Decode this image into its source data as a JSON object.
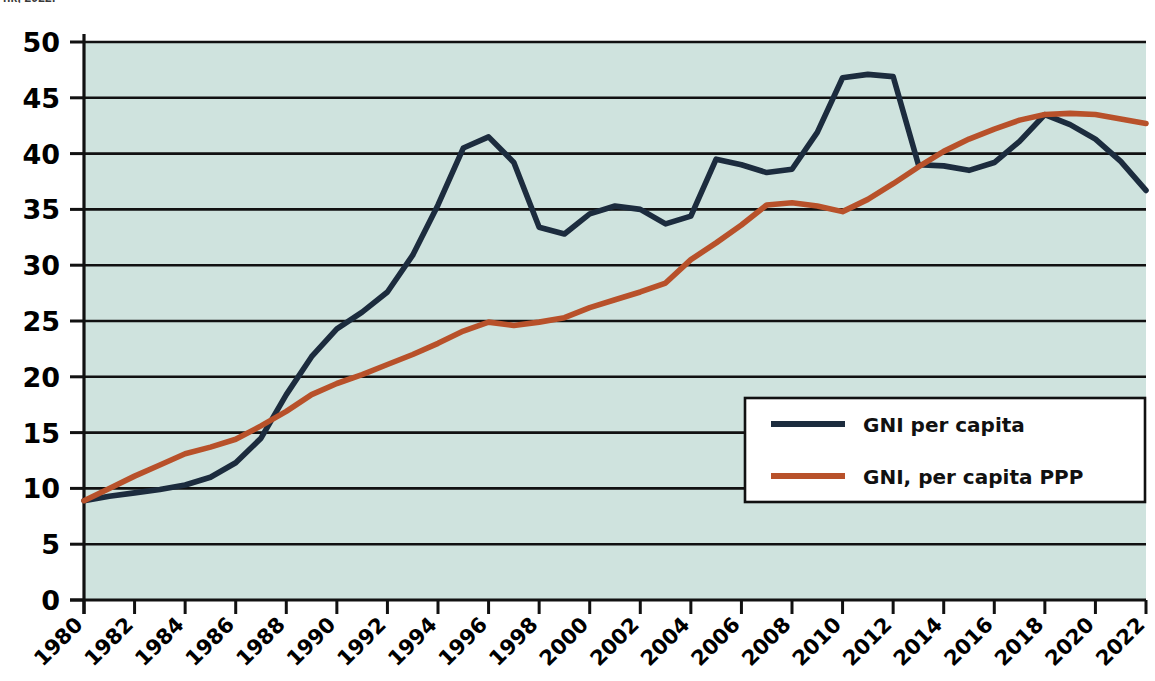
{
  "caption": {
    "source_note": "nk, 2022."
  },
  "colors": {
    "plot_background": "#cfe3de",
    "page_background": "#ffffff",
    "gridline": "#111111",
    "axis": "#111111",
    "series_gni_per_capita": "#1c2c3e",
    "series_gni_per_capita_ppp": "#b8512a",
    "legend_background": "#ffffff",
    "legend_border": "#111111"
  },
  "legend": {
    "position": "inside-right-middle",
    "entries": [
      {
        "label": "GNI per capita",
        "color": "#1c2c3e"
      },
      {
        "label": "GNI, per capita PPP",
        "color": "#b8512a"
      }
    ]
  },
  "chart_data": {
    "type": "line",
    "title": "",
    "subtitle": "",
    "xlabel": "",
    "ylabel": "",
    "grid": true,
    "legend_position": "inside-right-middle",
    "xlim": [
      1980,
      2022
    ],
    "ylim": [
      0,
      50
    ],
    "ytick_step": 5,
    "yticks": [
      0,
      5,
      10,
      15,
      20,
      25,
      30,
      35,
      40,
      45,
      50
    ],
    "ytick_labels": [
      "0",
      "5",
      "10",
      "15",
      "20",
      "25",
      "30",
      "35",
      "40",
      "45",
      "50"
    ],
    "xticks": [
      1980,
      1982,
      1984,
      1986,
      1988,
      1990,
      1992,
      1994,
      1996,
      1998,
      2000,
      2002,
      2004,
      2006,
      2008,
      2010,
      2012,
      2014,
      2016,
      2018,
      2020,
      2022
    ],
    "xtick_labels": [
      "1980",
      "1982",
      "1984",
      "1986",
      "1988",
      "1990",
      "1992",
      "1994",
      "1996",
      "1998",
      "2000",
      "2002",
      "2004",
      "2006",
      "2008",
      "2010",
      "2012",
      "2014",
      "2016",
      "2018",
      "2020",
      "2022"
    ],
    "xtick_rotation": -45,
    "x": [
      1980,
      1981,
      1982,
      1983,
      1984,
      1985,
      1986,
      1987,
      1988,
      1989,
      1990,
      1991,
      1992,
      1993,
      1994,
      1995,
      1996,
      1997,
      1998,
      1999,
      2000,
      2001,
      2002,
      2003,
      2004,
      2005,
      2006,
      2007,
      2008,
      2009,
      2010,
      2011,
      2012,
      2013,
      2014,
      2015,
      2016,
      2017,
      2018,
      2019,
      2020,
      2021,
      2022
    ],
    "series": [
      {
        "name": "GNI per capita",
        "color": "#1c2c3e",
        "values": [
          8.9,
          9.3,
          9.6,
          9.9,
          10.3,
          11.0,
          12.3,
          14.5,
          18.4,
          21.8,
          24.3,
          25.8,
          27.6,
          30.9,
          35.4,
          40.5,
          41.5,
          39.2,
          33.4,
          32.8,
          34.6,
          35.3,
          35.0,
          33.7,
          34.4,
          39.5,
          39.0,
          38.3,
          38.6,
          41.9,
          46.8,
          47.1,
          46.9,
          39.0,
          38.9,
          38.5,
          39.2,
          41.1,
          43.5,
          42.6,
          41.3,
          39.3,
          36.7
        ]
      },
      {
        "name": "GNI, per capita PPP",
        "color": "#b8512a",
        "values": [
          8.9,
          10.0,
          11.1,
          12.1,
          13.1,
          13.7,
          14.4,
          15.6,
          16.9,
          18.4,
          19.4,
          20.2,
          21.1,
          22.0,
          23.0,
          24.1,
          24.9,
          24.6,
          24.9,
          25.3,
          26.2,
          26.9,
          27.6,
          28.4,
          30.5,
          32.0,
          33.6,
          35.4,
          35.6,
          35.3,
          34.8,
          35.9,
          37.3,
          38.8,
          40.2,
          41.3,
          42.2,
          43.0,
          43.5,
          43.6,
          43.5,
          43.1,
          42.7
        ]
      }
    ]
  }
}
